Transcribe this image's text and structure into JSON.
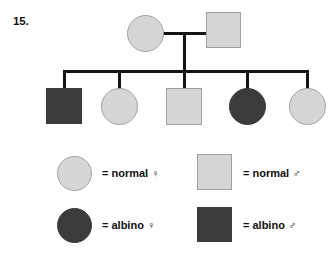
{
  "question": {
    "number_label": "15."
  },
  "colors": {
    "normal_fill": "#d6d6d6",
    "normal_stroke": "#a2a2a2",
    "affected_fill": "#3b3b3b",
    "line": "#141414",
    "text": "#111111",
    "background": "#ffffff"
  },
  "pedigree": {
    "generations": [
      {
        "name": "parents",
        "individuals": [
          {
            "id": "I-1",
            "sex": "female",
            "shape": "circle",
            "status": "normal"
          },
          {
            "id": "I-2",
            "sex": "male",
            "shape": "square",
            "status": "normal"
          }
        ]
      },
      {
        "name": "children",
        "individuals": [
          {
            "id": "II-1",
            "sex": "male",
            "shape": "square",
            "status": "albino"
          },
          {
            "id": "II-2",
            "sex": "female",
            "shape": "circle",
            "status": "normal"
          },
          {
            "id": "II-3",
            "sex": "male",
            "shape": "square",
            "status": "normal"
          },
          {
            "id": "II-4",
            "sex": "female",
            "shape": "circle",
            "status": "albino"
          },
          {
            "id": "II-5",
            "sex": "female",
            "shape": "circle",
            "status": "normal"
          }
        ]
      }
    ]
  },
  "legend": {
    "entries": [
      {
        "key": "normal-female",
        "shape": "circle",
        "status": "normal",
        "label": "= normal ♀"
      },
      {
        "key": "normal-male",
        "shape": "square",
        "status": "normal",
        "label": "= normal ♂"
      },
      {
        "key": "albino-female",
        "shape": "circle",
        "status": "affected",
        "label": "= albino ♀"
      },
      {
        "key": "albino-male",
        "shape": "square",
        "status": "affected",
        "label": "= albino ♂"
      }
    ]
  }
}
